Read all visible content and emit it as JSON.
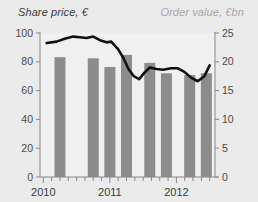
{
  "titles": {
    "left": "Share price, €",
    "right": "Order value, €bn"
  },
  "colors": {
    "background": "#ebebeb",
    "plot_background": "#f0f0f0",
    "bar": "#8c8c8c",
    "line": "#111111",
    "axis": "#888888",
    "text_dark": "#3a3a3a",
    "text_light": "#a8a8a8"
  },
  "axes": {
    "left": {
      "label": "Share price, €",
      "ticks": [
        "0",
        "20",
        "40",
        "60",
        "80",
        "100"
      ],
      "min": 0,
      "max": 100
    },
    "right": {
      "label": "Order value, €bn",
      "ticks": [
        "0",
        "5",
        "10",
        "15",
        "20",
        "25"
      ],
      "min": 0,
      "max": 25
    },
    "x": {
      "ticks": [
        "2010",
        "2011",
        "2012"
      ]
    }
  },
  "chart_data": {
    "type": "bar",
    "title": "",
    "subtitle": "",
    "xlabel": "",
    "ylabel": "Share price, €",
    "y2label": "Order value, €bn",
    "ylim": [
      0,
      100
    ],
    "y2lim": [
      0,
      25
    ],
    "grid": false,
    "legend": "none",
    "x_tick_labels": [
      "2010",
      "2011",
      "2012"
    ],
    "x_tick_values": [
      2010.0,
      2011.0,
      2012.0
    ],
    "series": [
      {
        "name": "Order value",
        "type": "bar",
        "axis": "right",
        "unit": "€bn",
        "color": "#8c8c8c",
        "x": [
          2010.25,
          2010.75,
          2011.0,
          2011.25,
          2011.6,
          2011.85,
          2012.2,
          2012.45
        ],
        "categories": [
          "Q2 2010",
          "Q4 2010",
          "Q1 2011",
          "Q2 2011",
          "Q3 2011",
          "Q4 2011",
          "Q2 2012",
          "Q3 2012"
        ],
        "values": [
          20.8,
          20.6,
          19.1,
          21.2,
          19.8,
          18.0,
          17.7,
          18.0
        ]
      },
      {
        "name": "Share price",
        "type": "line",
        "axis": "left",
        "unit": "€",
        "color": "#111111",
        "x": [
          2010.05,
          2010.2,
          2010.32,
          2010.45,
          2010.55,
          2010.65,
          2010.75,
          2010.85,
          2010.95,
          2011.02,
          2011.12,
          2011.2,
          2011.28,
          2011.36,
          2011.44,
          2011.52,
          2011.6,
          2011.7,
          2011.8,
          2011.92,
          2012.02,
          2012.12,
          2012.22,
          2012.32,
          2012.42,
          2012.5
        ],
        "values": [
          93,
          94,
          96,
          97.5,
          97,
          96.5,
          97.5,
          95,
          93.5,
          94,
          89,
          83,
          75,
          70,
          68,
          72.5,
          76,
          75,
          74.5,
          75.5,
          75.5,
          73,
          69,
          66.5,
          70,
          77.5
        ]
      }
    ]
  }
}
